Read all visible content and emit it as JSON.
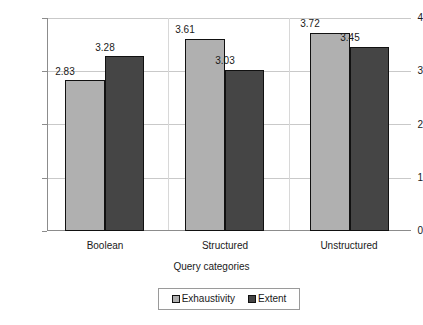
{
  "chart_data": {
    "type": "bar",
    "title": "",
    "xlabel": "Query categories",
    "ylabel": "Exhaustivity/Extent",
    "categories": [
      "Boolean",
      "Structured",
      "Unstructured"
    ],
    "series": [
      {
        "name": "Exhaustivity",
        "color": "#b0b0b0",
        "values": [
          2.83,
          3.61,
          3.72
        ]
      },
      {
        "name": "Extent",
        "color": "#454545",
        "values": [
          3.28,
          3.03,
          3.45
        ]
      }
    ],
    "value_labels": [
      [
        "2.83",
        "3.28"
      ],
      [
        "3.61",
        "3.03"
      ],
      [
        "3.72",
        "3.45"
      ]
    ],
    "ylim": [
      0,
      4
    ],
    "yticks": [
      0,
      1,
      2,
      3,
      4
    ],
    "ytick_labels": [
      "0",
      "1",
      "2",
      "3",
      "4"
    ],
    "grid": true,
    "legend_position": "bottom"
  },
  "axes": {
    "y_title": "Exhaustivity/Extent",
    "x_title": "Query categories",
    "y_labels": {
      "t4": "4",
      "t3": "3",
      "t2": "2",
      "t1": "1",
      "t0": "0"
    },
    "x_labels": {
      "c0": "Boolean",
      "c1": "Structured",
      "c2": "Unstructured"
    }
  },
  "legend": {
    "items": [
      {
        "label": "Exhaustivity",
        "swatch": "light-gray-swatch"
      },
      {
        "label": "Extent",
        "swatch": "dark-gray-swatch"
      }
    ]
  },
  "bars": {
    "g0s0": "2.83",
    "g0s1": "3.28",
    "g1s0": "3.61",
    "g1s1": "3.03",
    "g2s0": "3.72",
    "g2s1": "3.45"
  }
}
